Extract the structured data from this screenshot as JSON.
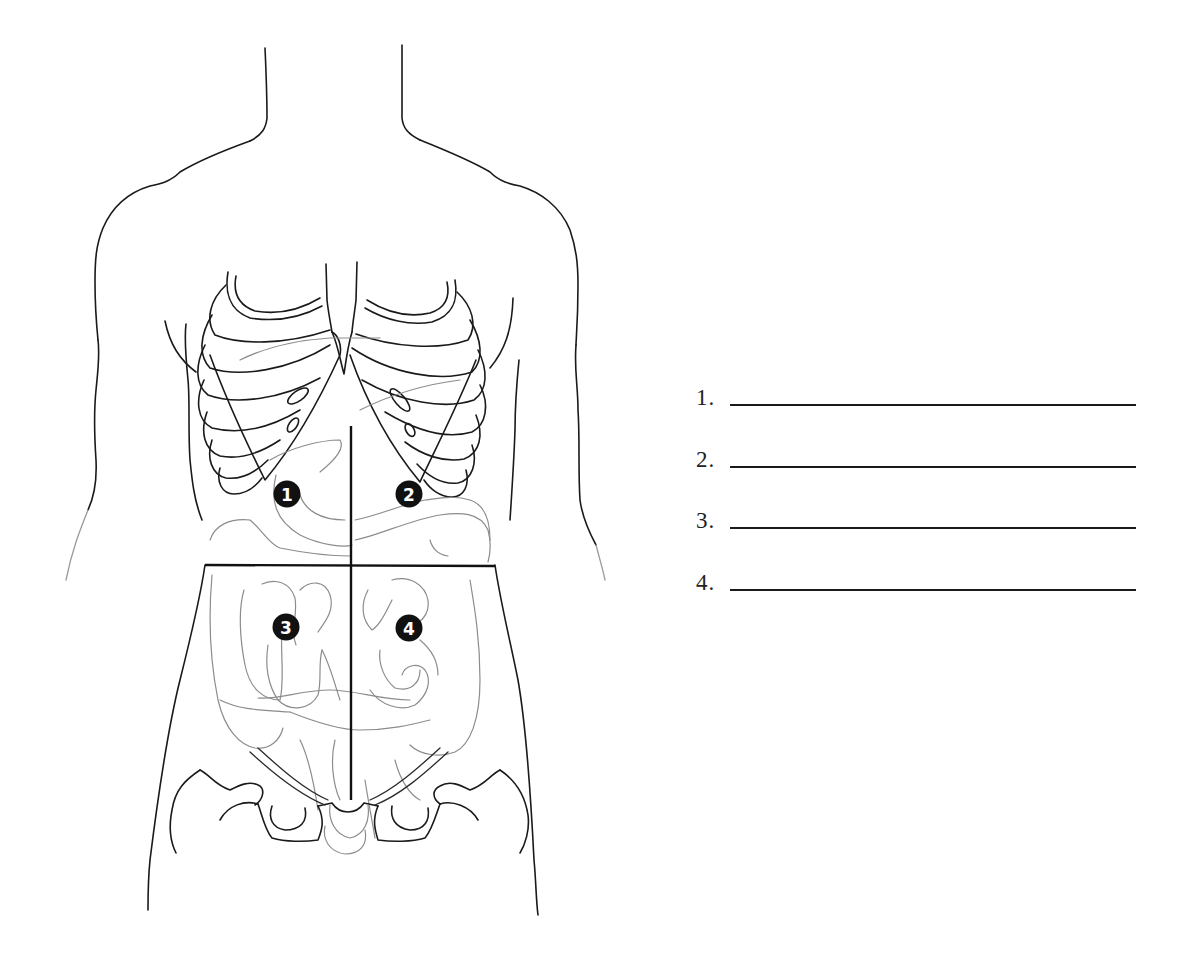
{
  "figure": {
    "divider_lines": [
      "vertical-midline",
      "horizontal-umbilical-line"
    ],
    "markers": [
      {
        "id": 1,
        "label": "1",
        "quadrant": "upper-right (patient's right)"
      },
      {
        "id": 2,
        "label": "2",
        "quadrant": "upper-left (patient's left)"
      },
      {
        "id": 3,
        "label": "3",
        "quadrant": "lower-right (patient's right)"
      },
      {
        "id": 4,
        "label": "4",
        "quadrant": "lower-left (patient's left)"
      }
    ],
    "colors": {
      "outline": "#1a1a1a",
      "organs": "#8c8c8c",
      "marker_fill": "#111111",
      "marker_text": "#ffffff"
    }
  },
  "answers": [
    {
      "number": "1.",
      "value": ""
    },
    {
      "number": "2.",
      "value": ""
    },
    {
      "number": "3.",
      "value": ""
    },
    {
      "number": "4.",
      "value": ""
    }
  ]
}
